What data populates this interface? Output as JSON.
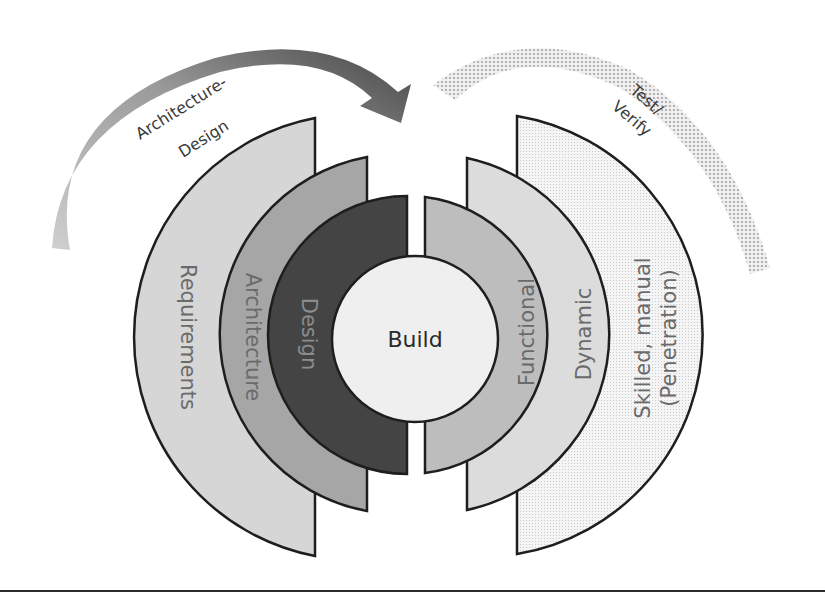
{
  "diagram": {
    "arrows": {
      "left": {
        "label_line1": "Architecture-",
        "label_line2": "Design",
        "color_start": "#c8c8c8",
        "color_end": "#4a4a4a"
      },
      "right": {
        "label_line1": "Test/",
        "label_line2": "Verify",
        "color": "#b5b5b5",
        "pattern": "dotted"
      }
    },
    "center": {
      "label": "Build",
      "fill": "#efefef"
    },
    "left_rings": [
      {
        "label": "Requirements",
        "fill": "#d6d6d6"
      },
      {
        "label": "Architecture",
        "fill": "#a6a6a6"
      },
      {
        "label": "Design",
        "fill": "#444444"
      }
    ],
    "right_rings": [
      {
        "label": "Functional",
        "fill": "#bdbdbd"
      },
      {
        "label": "Dynamic",
        "fill": "#dcdcdc"
      },
      {
        "label_line1": "Skilled, manual",
        "label_line2": "(Penetration)",
        "fill": "#f2f2f2"
      }
    ]
  }
}
